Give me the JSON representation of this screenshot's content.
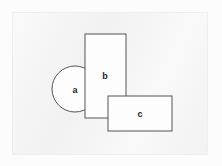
{
  "figure": {
    "canvas": {
      "width": 222,
      "height": 166
    },
    "background_color": "#fcfcfc",
    "panel": {
      "x": 12,
      "y": 12,
      "width": 196,
      "height": 143,
      "fill": "#f3f3f3",
      "border_color": "#efefef"
    },
    "stroke_color": "#555555",
    "shape_fill": "#fdfdfd",
    "label_color": "#1f1f1f"
  },
  "shapes": [
    {
      "id": "a",
      "label": "a",
      "kind": "circle",
      "cx": 75,
      "cy": 89,
      "r": 23,
      "label_x": 75,
      "label_y": 90,
      "z": 1
    },
    {
      "id": "b",
      "label": "b",
      "kind": "rect",
      "x": 85,
      "y": 34,
      "width": 41,
      "height": 84,
      "label_x": 105,
      "label_y": 76,
      "z": 2
    },
    {
      "id": "c",
      "label": "c",
      "kind": "rect",
      "x": 108,
      "y": 96,
      "width": 64,
      "height": 35,
      "label_x": 140,
      "label_y": 114,
      "z": 3
    }
  ]
}
